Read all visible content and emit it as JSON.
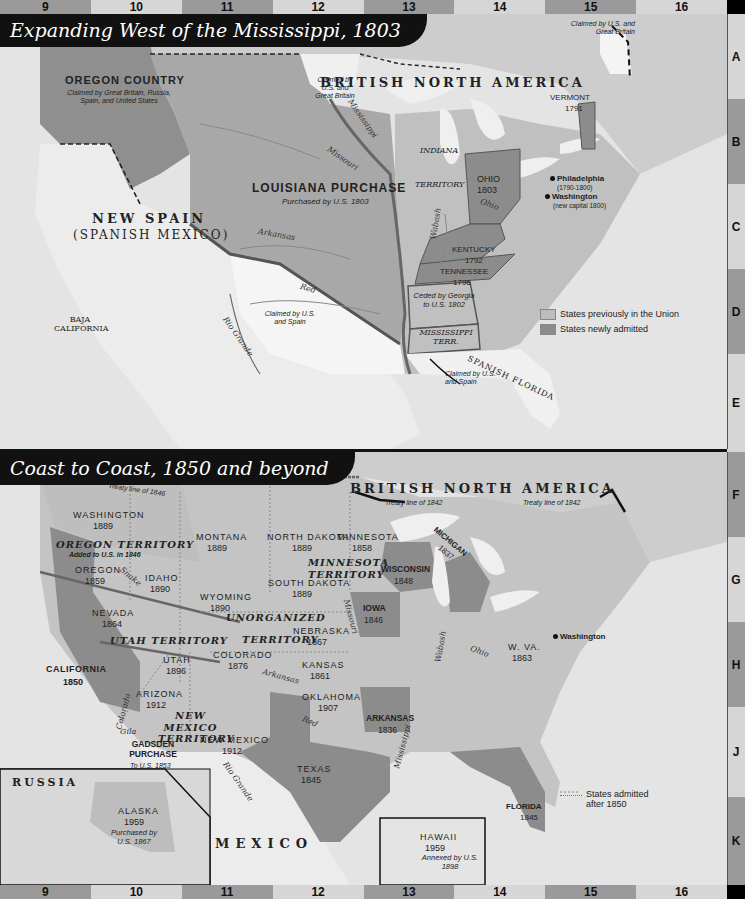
{
  "grid": {
    "columns": [
      "9",
      "10",
      "11",
      "12",
      "13",
      "14",
      "15",
      "16"
    ],
    "rows": [
      "A",
      "B",
      "C",
      "D",
      "E",
      "F",
      "G",
      "H",
      "J",
      "K"
    ]
  },
  "map1": {
    "title": "Expanding West of the Mississippi, 1803",
    "labels": {
      "british_north_america": "BRITISH NORTH AMERICA",
      "oregon_country": "OREGON COUNTRY",
      "oregon_country_note": "Claimed by Great Britain, Russia, Spain, and United States",
      "claimed_us_gb_north": "Claimed by U.S. and Great Britain",
      "claimed_us_gb_ne": "Claimed by U.S. and Great Britain",
      "louisiana_purchase": "LOUISIANA PURCHASE",
      "louisiana_purchase_note": "Purchased by U.S. 1803",
      "new_spain": "NEW SPAIN",
      "new_spain_sub": "(SPANISH MEXICO)",
      "baja_california": "BAJA CALIFORNIA",
      "claimed_us_spain_west": "Claimed by U.S. and Spain",
      "claimed_us_spain_south": "Claimed by U.S. and Spain",
      "indiana": "INDIANA",
      "territory": "TERRITORY",
      "ohio": "OHIO",
      "ohio_year": "1803",
      "kentucky": "KENTUCKY",
      "kentucky_year": "1792",
      "tennessee": "TENNESSEE",
      "tennessee_year": "1796",
      "vermont": "VERMONT",
      "vermont_year": "1791",
      "ceded_georgia": "Ceded by Georgia to U.S. 1802",
      "mississippi_terr": "MISSISSIPPI TERR.",
      "spanish_florida": "SPANISH FLORIDA",
      "philadelphia": "Philadelphia",
      "philadelphia_note": "(1790-1800)",
      "washington": "Washington",
      "washington_note": "(new capital 1800)"
    },
    "rivers": {
      "mississippi": "Mississippi",
      "missouri": "Missouri",
      "arkansas": "Arkansas",
      "red": "Red",
      "rio_grande": "Rio Grande",
      "wabash": "Wabash",
      "ohio": "Ohio"
    },
    "legend": {
      "previous": "States previously in the Union",
      "new": "States newly admitted"
    }
  },
  "map2": {
    "title": "Coast to Coast, 1850 and beyond",
    "labels": {
      "british_north_america": "BRITISH NORTH AMERICA",
      "treaty_1846": "Treaty line of 1846",
      "treaty_1842_a": "Treaty line of 1842",
      "treaty_1842_b": "Treaty line of 1842",
      "washington": "WASHINGTON",
      "washington_year": "1889",
      "oregon_territory": "OREGON TERRITORY",
      "oregon_territory_note": "Added to U.S. in 1846",
      "oregon": "OREGON",
      "oregon_year": "1859",
      "idaho": "IDAHO",
      "idaho_year": "1890",
      "montana": "MONTANA",
      "montana_year": "1889",
      "north_dakota": "NORTH DAKOTA",
      "north_dakota_year": "1889",
      "south_dakota": "SOUTH DAKOTA",
      "south_dakota_year": "1889",
      "minnesota": "MINNESOTA",
      "minnesota_year": "1858",
      "minnesota_territory": "MINNESOTA TERRITORY",
      "wyoming": "WYOMING",
      "wyoming_year": "1890",
      "unorganized": "UNORGANIZED",
      "territory": "TERRITORY",
      "nebraska": "NEBRASKA",
      "nebraska_year": "1867",
      "nevada": "NEVADA",
      "nevada_year": "1864",
      "utah_territory": "UTAH TERRITORY",
      "utah": "UTAH",
      "utah_year": "1896",
      "colorado": "COLORADO",
      "colorado_year": "1876",
      "kansas": "KANSAS",
      "kansas_year": "1861",
      "california": "CALIFORNIA",
      "california_year": "1850",
      "arizona": "ARIZONA",
      "arizona_year": "1912",
      "new_mexico_territory": "NEW MEXICO TERRITORY",
      "new_mexico": "NEW MEXICO",
      "new_mexico_year": "1912",
      "oklahoma": "OKLAHOMA",
      "oklahoma_year": "1907",
      "gadsden": "GADSDEN PURCHASE",
      "gadsden_note": "To U.S. 1853",
      "texas": "TEXAS",
      "texas_year": "1845",
      "wisconsin": "WISCONSIN",
      "wisconsin_year": "1848",
      "michigan": "MICHIGAN",
      "michigan_year": "1837",
      "iowa": "IOWA",
      "iowa_year": "1846",
      "arkansas": "ARKANSAS",
      "arkansas_year": "1836",
      "florida": "FLORIDA",
      "florida_year": "1845",
      "w_va": "W. VA.",
      "w_va_year": "1863",
      "washington_dc": "Washington",
      "russia": "RUSSIA",
      "alaska": "ALASKA",
      "alaska_year": "1959",
      "alaska_note": "Purchased by U.S. 1867",
      "mexico": "MEXICO",
      "hawaii": "HAWAII",
      "hawaii_year": "1959",
      "hawaii_note": "Annexed by U.S. 1898"
    },
    "rivers": {
      "snake": "Snake",
      "missouri": "Missouri",
      "arkansas": "Arkansas",
      "colorado": "Colorado",
      "gila": "Gila",
      "red": "Red",
      "rio_grande": "Rio Grande",
      "mississippi": "Mississippi",
      "wabash": "Wabash",
      "ohio": "Ohio"
    },
    "legend": {
      "after_1850": "States admitted after 1850"
    }
  },
  "colors": {
    "water": "#e6e6e6",
    "land": "#cfcfcf",
    "previous_states": "#bdbdbd",
    "new_states": "#8c8c8c",
    "louisiana": "#a8a8a8",
    "oregon_country": "#8f8f8f",
    "foreign": "#e8e8e8",
    "title_bg": "#111111",
    "grid_dark": "#9a9a9a",
    "grid_light": "#d6d6d6"
  }
}
